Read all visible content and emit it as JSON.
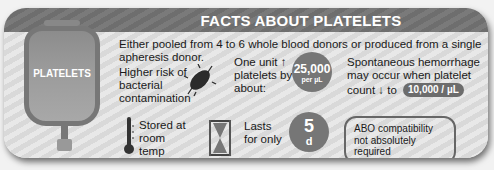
{
  "header": {
    "title": "FACTS ABOUT PLATELETS"
  },
  "bag": {
    "label": "PLATELETS"
  },
  "source": {
    "text_line1": "Either pooled from 4 to 6 whole blood donors or produced from a single",
    "text_line2": "apheresis donor."
  },
  "contamination": {
    "line1": "Higher risk of",
    "line2": "bacterial",
    "line3": "contamination",
    "icon": "bacterium-icon"
  },
  "increase": {
    "line1": "One unit ↑",
    "line2": "platelets by",
    "line3": "about:",
    "value": "25,000",
    "unit": "per µL"
  },
  "hemorrhage": {
    "line1": "Spontaneous hemorrhage",
    "line2": "may occur when platelet",
    "line3": "count ↓ to",
    "threshold": "10,000 / µL"
  },
  "storage": {
    "line1": "Stored at",
    "line2": "room",
    "line3": "temp",
    "icon": "thermometer-icon"
  },
  "shelf_life": {
    "line1": "Lasts",
    "line2": "for only",
    "value": "5",
    "unit": "d",
    "icon": "hourglass-icon"
  },
  "abo": {
    "line1": "ABO compatibility",
    "line2": "not absolutely",
    "line3": "required"
  },
  "colors": {
    "header": "#737373",
    "circle": "#767676",
    "background": "#e0e0e0"
  }
}
